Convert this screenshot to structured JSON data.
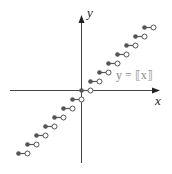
{
  "chart_data": {
    "type": "scatter",
    "title": "",
    "function_label": "y = ⟦x⟧",
    "xlabel": "x",
    "ylabel": "y",
    "grid": false,
    "steps": [
      {
        "x_start": -7,
        "x_end": -6,
        "y": -7
      },
      {
        "x_start": -6,
        "x_end": -5,
        "y": -6
      },
      {
        "x_start": -5,
        "x_end": -4,
        "y": -5
      },
      {
        "x_start": -4,
        "x_end": -3,
        "y": -4
      },
      {
        "x_start": -3,
        "x_end": -2,
        "y": -3
      },
      {
        "x_start": -2,
        "x_end": -1,
        "y": -2
      },
      {
        "x_start": -1,
        "x_end": 0,
        "y": -1
      },
      {
        "x_start": 0,
        "x_end": 1,
        "y": 0
      },
      {
        "x_start": 1,
        "x_end": 2,
        "y": 1
      },
      {
        "x_start": 2,
        "x_end": 3,
        "y": 2
      },
      {
        "x_start": 3,
        "x_end": 4,
        "y": 3
      },
      {
        "x_start": 4,
        "x_end": 5,
        "y": 4
      },
      {
        "x_start": 5,
        "x_end": 6,
        "y": 5
      },
      {
        "x_start": 6,
        "x_end": 7,
        "y": 6
      },
      {
        "x_start": 7,
        "x_end": 8,
        "y": 7
      }
    ],
    "colors": {
      "axis": "#333333",
      "closed_dot": "#555555",
      "open_dot": "#555555",
      "label": "#888888"
    }
  }
}
